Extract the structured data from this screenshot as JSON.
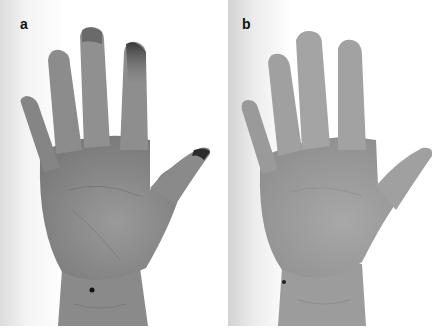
{
  "figure": {
    "panels": [
      {
        "label": "a",
        "description": "Palm of left hand with dark discoloration/staining at fingertips and thumb tip; black dot mark on lower palm near wrist",
        "colors": {
          "skin": "#8e8e8e",
          "stain": "#3a3a3a",
          "background": "#ffffff"
        }
      },
      {
        "label": "b",
        "description": "Same palm after treatment, fingertips no longer stained; black dot mark on lower palm near wrist",
        "colors": {
          "skin": "#a2a2a2",
          "background": "#ffffff"
        }
      }
    ]
  }
}
